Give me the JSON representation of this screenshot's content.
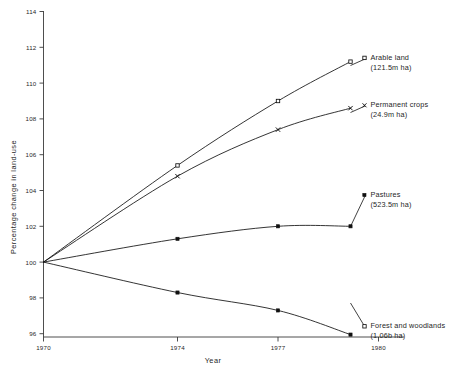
{
  "chart_data": {
    "type": "line",
    "title": "",
    "subtitle": "",
    "xlabel": "Year",
    "ylabel": "Percentage change in land-use",
    "x": [
      1970,
      1974,
      1977,
      1980
    ],
    "xtick_labels": [
      "1970",
      "1974",
      "1977",
      "1980"
    ],
    "ytick_labels": [
      "96",
      "98",
      "100",
      "102",
      "104",
      "106",
      "108",
      "110",
      "112",
      "114"
    ],
    "ytick_values": [
      96,
      98,
      100,
      102,
      104,
      106,
      108,
      110,
      112,
      114
    ],
    "ylim": [
      95.2,
      114.4
    ],
    "xlim": [
      1970,
      1980
    ],
    "grid": false,
    "legend_position": "right-inline-annotations",
    "series": [
      {
        "name": "Arable land",
        "annotation": "Arable land",
        "annotation_detail": "(121.5m ha)",
        "marker": "open-square",
        "values": [
          100.0,
          105.4,
          109.0,
          111.2
        ]
      },
      {
        "name": "Permanent crops",
        "annotation": "Permanent crops",
        "annotation_detail": "(24.9m ha)",
        "marker": "cross",
        "values": [
          100.0,
          104.8,
          107.4,
          108.6
        ]
      },
      {
        "name": "Pastures",
        "annotation": "Pastures",
        "annotation_detail": "(523.5m ha)",
        "marker": "filled-square",
        "values": [
          100.0,
          101.3,
          102.0,
          102.0
        ]
      },
      {
        "name": "Forest and woodlands",
        "annotation": "Forest and woodlands",
        "annotation_detail": "(1.06b ha)",
        "marker": "filled-square",
        "values": [
          100.0,
          98.3,
          97.3,
          95.95
        ]
      }
    ]
  },
  "colors": {
    "line": "#111111",
    "axis": "#3a3a3a",
    "background": "#ffffff",
    "text": "#1f1f1f"
  },
  "axes": {
    "x_title": "Year",
    "y_title": "Percentage change in land-use"
  },
  "yticks": {
    "t0": "96",
    "t1": "98",
    "t2": "100",
    "t3": "102",
    "t4": "104",
    "t5": "106",
    "t6": "108",
    "t7": "110",
    "t8": "112",
    "t9": "114"
  },
  "xticks": {
    "t0": "1970",
    "t1": "1974",
    "t2": "1977",
    "t3": "1980"
  },
  "annotations": {
    "arable_name": "Arable land",
    "arable_detail": "(121.5m ha)",
    "permanent_name": "Permanent crops",
    "permanent_detail": "(24.9m ha)",
    "pastures_name": "Pastures",
    "pastures_detail": "(523.5m ha)",
    "forest_name": "Forest and woodlands",
    "forest_detail": "(1.06b ha)"
  }
}
